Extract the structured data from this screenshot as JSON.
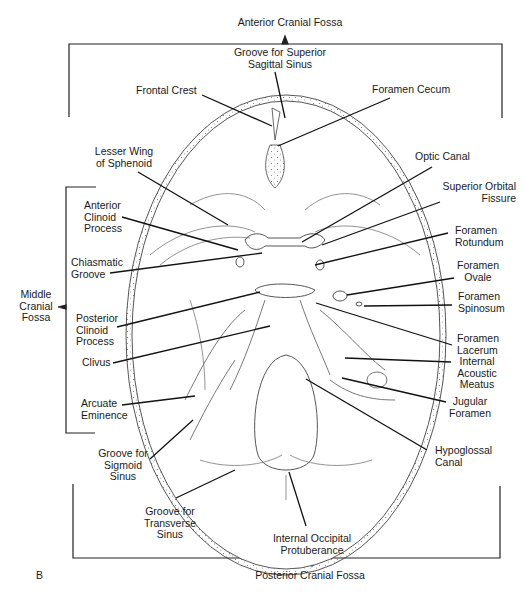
{
  "diagram": {
    "panel_letter": "B",
    "regions": {
      "anterior": "Anterior Cranial Fossa",
      "middle": "Middle\nCranial\nFossa",
      "posterior": "Posterior Cranial Fossa"
    },
    "labels": {
      "groove_superior_sagittal": "Groove for Superior\nSagittal Sinus",
      "frontal_crest": "Frontal Crest",
      "foramen_cecum": "Foramen Cecum",
      "lesser_wing": "Lesser Wing\nof Sphenoid",
      "optic_canal": "Optic Canal",
      "anterior_clinoid": "Anterior\nClinoid\nProcess",
      "superior_orbital_fissure": "Superior Orbital\nFissure",
      "foramen_rotundum": "Foramen\nRotundum",
      "chiasmatic_groove": "Chiasmatic\nGroove",
      "foramen_ovale": "Foramen\nOvale",
      "foramen_spinosum": "Foramen\nSpinosum",
      "posterior_clinoid": "Posterior\nClinoid\nProcess",
      "foramen_lacerum": "Foramen\nLacerum",
      "clivus": "Clivus",
      "internal_acoustic": "Internal\nAcoustic\nMeatus",
      "arcuate_eminence": "Arcuate\nEminence",
      "jugular_foramen": "Jugular\nForamen",
      "groove_sigmoid": "Groove for\nSigmoid\nSinus",
      "hypoglossal_canal": "Hypoglossal\nCanal",
      "groove_transverse": "Groove for\nTransverse\nSinus",
      "internal_occipital": "Internal Occipital\nProtuberance"
    }
  }
}
